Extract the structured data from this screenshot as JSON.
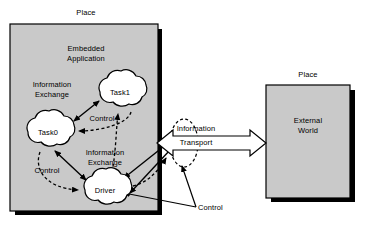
{
  "diagram": {
    "title_left_place": "Place",
    "title_right_place": "Place",
    "left_box": {
      "heading_line1": "Embedded",
      "heading_line2": "Application",
      "nodes": [
        {
          "id": "task0",
          "label": "Task0",
          "cx": 48,
          "cy": 132
        },
        {
          "id": "task1",
          "label": "Task1",
          "cx": 120,
          "cy": 92
        },
        {
          "id": "driver",
          "label": "Driver",
          "cx": 105,
          "cy": 190
        }
      ],
      "edge_labels": [
        {
          "id": "info-exchange-1",
          "line1": "Information",
          "line2": "Exchange",
          "x": 52,
          "y": 84
        },
        {
          "id": "control-1",
          "line1": "Control",
          "line2": "",
          "x": 100,
          "y": 118
        },
        {
          "id": "info-exchange-2",
          "line1": "Information",
          "line2": "Exchange",
          "x": 105,
          "y": 152
        },
        {
          "id": "control-2",
          "line1": "Control",
          "line2": "",
          "x": 45,
          "y": 170
        }
      ]
    },
    "transport": {
      "label_line1": "Information",
      "label_line2": "Transport"
    },
    "control_outside": "Control",
    "right_box": {
      "label_line1": "External",
      "label_line2": "World"
    }
  },
  "colors": {
    "box_fill": "#c9c9c9",
    "box_border": "#000000",
    "shadow": "#000000",
    "cloud_fill": "#ffffff",
    "line": "#000000",
    "text": "#000000"
  }
}
